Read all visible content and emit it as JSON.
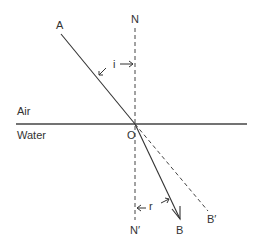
{
  "diagram": {
    "points": {
      "A": "A",
      "N": "N",
      "O": "O",
      "B": "B",
      "B_prime": "B′",
      "N_prime": "N′"
    },
    "angles": {
      "incidence": "i",
      "refraction": "r"
    },
    "media": {
      "top": "Air",
      "bottom": "Water"
    },
    "colors": {
      "line": "#333333",
      "background": "#ffffff"
    }
  }
}
